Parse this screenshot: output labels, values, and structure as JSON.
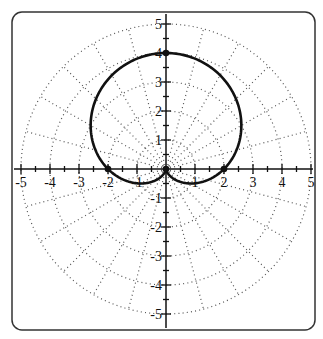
{
  "chart_data": {
    "type": "line",
    "subtype": "polar",
    "title": "",
    "equation": "r = 2 + 2 sin(theta)",
    "xlabel": "",
    "ylabel": "",
    "xlim": [
      -5,
      5
    ],
    "ylim": [
      -5,
      5
    ],
    "x_ticks": [
      "-5",
      "-4",
      "-3",
      "-2",
      "-1",
      "1",
      "2",
      "3",
      "4",
      "5"
    ],
    "y_ticks": [
      "5",
      "4",
      "3",
      "2",
      "1",
      "-1",
      "-2",
      "-3",
      "-4",
      "-5"
    ],
    "polar_grid": {
      "rings": [
        1,
        2,
        3,
        4,
        5
      ],
      "spoke_step_deg": 15,
      "style": "dotted"
    },
    "highlighted_points": [
      {
        "x": 0,
        "y": 4
      },
      {
        "x": -2,
        "y": 0
      },
      {
        "x": 2,
        "y": 0
      },
      {
        "x": 0,
        "y": 0
      }
    ],
    "series": [
      {
        "name": "cardioid",
        "a": 2,
        "b": 2,
        "fn": "sin"
      }
    ]
  },
  "colors": {
    "curve": "#111111",
    "grid": "#555555",
    "axis": "#111111",
    "frame": "#333333"
  }
}
